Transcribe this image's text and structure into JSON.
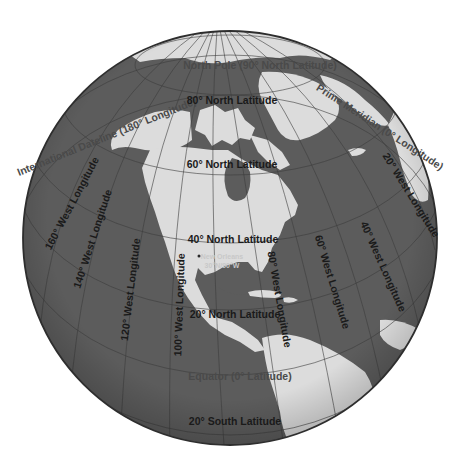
{
  "map": {
    "title": "North America globe with latitude and longitude lines",
    "colors": {
      "ocean": "#5c5c5c",
      "land": "#dcdcdc",
      "rim": "#2e2e2e",
      "label": "#1a1a1a",
      "special_label": "#4a4a4a",
      "city_label": "#c8c8c8"
    },
    "special_lines": {
      "north_pole": "North Pole (90° North Latitude)",
      "dateline": "International Dateline (180° Longitude)",
      "prime_meridian": "Prime Meridian (0° Longitude)",
      "equator": "Equator (0° Latitude)"
    },
    "latitudes": [
      "80° North Latitude",
      "60° North Latitude",
      "40° North Latitude",
      "20° North Latitude",
      "20° South Latitude"
    ],
    "longitudes": [
      "160° West Longitude",
      "140° West Longitude",
      "120° West Longitude",
      "100° West Longitude",
      "80° West Longitude",
      "60° West Longitude",
      "40° West Longitude",
      "20° West Longitude"
    ],
    "city": {
      "name": "New Orleans",
      "coords": "30°N/90°W"
    }
  }
}
